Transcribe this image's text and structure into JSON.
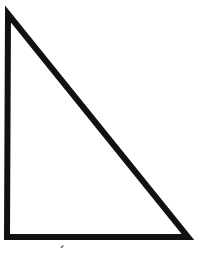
{
  "diagram": {
    "shape": "right-triangle",
    "vertices": [
      [
        8,
        12
      ],
      [
        7,
        237
      ],
      [
        188,
        237
      ]
    ],
    "stroke_color": "#111111",
    "stroke_width": 6,
    "fill": "#ffffff"
  },
  "label": {
    "text": "´"
  }
}
